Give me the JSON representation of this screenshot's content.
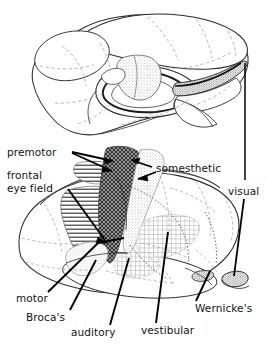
{
  "figure": {
    "background_color": "#ffffff",
    "line_color": "#2b2b2b",
    "dashed_color": "#9a9a9a",
    "leader_color": "#000000",
    "views": [
      {
        "name": "medial-sagittal-view",
        "position": "top"
      },
      {
        "name": "lateral-view",
        "position": "bottom"
      }
    ]
  },
  "labels": {
    "premotor": "premotor",
    "frontal": "frontal",
    "eye_field": "eye field",
    "somesthetic": "somesthetic",
    "visual": "visual",
    "motor": "motor",
    "brocas": "Broca's",
    "auditory": "auditory",
    "vestibular": "vestibular",
    "wernickes": "Wernicke's"
  },
  "regions": [
    {
      "name": "premotor",
      "pattern": "horizontal-lines",
      "label": "premotor"
    },
    {
      "name": "frontal-eye-field",
      "pattern": "horizontal-lines",
      "label": "frontal eye field"
    },
    {
      "name": "motor",
      "pattern": "dark-crosshatch",
      "label": "motor"
    },
    {
      "name": "somesthetic",
      "pattern": "light-stipple",
      "label": "somesthetic"
    },
    {
      "name": "visual",
      "pattern": "dense-stipple",
      "label": "visual"
    },
    {
      "name": "brocas",
      "pattern": "fine-stipple",
      "label": "Broca's"
    },
    {
      "name": "auditory",
      "pattern": "fine-grid",
      "label": "auditory"
    },
    {
      "name": "vestibular",
      "pattern": "fine-grid",
      "label": "vestibular"
    },
    {
      "name": "wernickes",
      "pattern": "fine-grid",
      "label": "Wernicke's"
    }
  ]
}
